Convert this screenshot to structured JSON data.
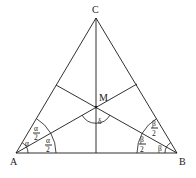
{
  "diagram": {
    "type": "triangle-angle-bisectors",
    "vertices": {
      "A": {
        "label": "A",
        "x": 16,
        "y": 153
      },
      "B": {
        "label": "B",
        "x": 177,
        "y": 153
      },
      "C": {
        "label": "C",
        "x": 96,
        "y": 18
      }
    },
    "incenter": {
      "label": "M",
      "x": 96,
      "y": 107
    },
    "angle_labels": {
      "alpha": "α",
      "alpha_half_num": "α",
      "alpha_half_den": "2",
      "beta": "β",
      "beta_half_num": "β",
      "beta_half_den": "2",
      "delta": "δ"
    }
  }
}
